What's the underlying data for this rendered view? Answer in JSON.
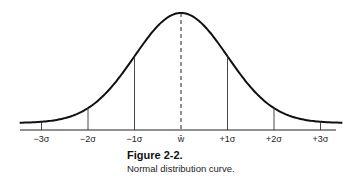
{
  "figure": {
    "caption_title": "Figure 2-2.",
    "caption_text": "Normal distribution curve."
  },
  "chart_data": {
    "type": "line",
    "title": "Normal distribution curve",
    "xlabel": "",
    "ylabel": "",
    "x_ticks": [
      "-3σ",
      "-2σ",
      "-1σ",
      "w̄",
      "+1σ",
      "+2σ",
      "+3σ"
    ],
    "x": [
      -3,
      -2,
      -1,
      0,
      1,
      2,
      3
    ],
    "series": [
      {
        "name": "normal density (relative)",
        "values": [
          0.011,
          0.135,
          0.607,
          1.0,
          0.607,
          0.135,
          0.011
        ]
      }
    ],
    "mean_line": {
      "x": 0,
      "style": "dashed"
    },
    "sigma_lines": {
      "style": "solid",
      "at": [
        -3,
        -2,
        -1,
        1,
        2,
        3
      ]
    },
    "grid": false,
    "legend": "none",
    "colors": {
      "curve": "#111111",
      "lines": "#333333",
      "axis": "#222222"
    }
  }
}
